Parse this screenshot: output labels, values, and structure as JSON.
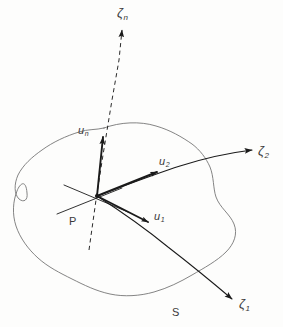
{
  "figure": {
    "background_color": "#fdfdfc",
    "curve_color": "#6e6e6e",
    "vector_color": "#1a1a1a",
    "label_color": "#3a3a3a"
  },
  "labels": {
    "zeta_n": {
      "base": "ζ",
      "sub": "n"
    },
    "zeta_1": {
      "base": "ζ",
      "sub": "1"
    },
    "zeta_2": {
      "base": "ζ",
      "sub": "2"
    },
    "u_n": {
      "base": "u",
      "sub": "n"
    },
    "u_1": {
      "base": "u",
      "sub": "1"
    },
    "u_2": {
      "base": "u",
      "sub": "2"
    },
    "point_p": {
      "base": "P",
      "sub": ""
    },
    "surface_s": {
      "base": "S",
      "sub": ""
    }
  },
  "elements": {
    "surface_boundary_name": "surface-boundary-curve",
    "normal_axis_name": "normal-axis-dashed-line",
    "coordinate_curve_1_name": "coordinate-curve-zeta1",
    "coordinate_curve_2_name": "coordinate-curve-zeta2",
    "tangent_plane_name": "tangent-plane-cross-lines",
    "origin_point_name": "point-p-marker"
  }
}
